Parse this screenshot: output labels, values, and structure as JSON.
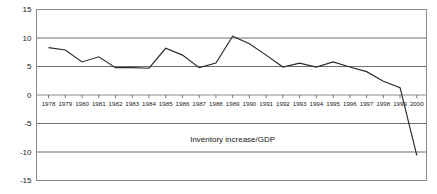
{
  "chart_data": {
    "type": "line",
    "title": "",
    "subtitle": "",
    "xlabel": "",
    "ylabel": "",
    "ylim": [
      -15,
      15
    ],
    "yticks": [
      15,
      10,
      5,
      0,
      -5,
      -10,
      -15
    ],
    "ytick_labels": [
      "15",
      "10",
      "5",
      "0",
      "-5",
      "-10",
      "-15"
    ],
    "grid": true,
    "grid_axis": "y",
    "legend": false,
    "legend_position": "none",
    "annotations": [
      {
        "text": "Inventory increase/GDP",
        "x": 1989,
        "y": -8.2
      }
    ],
    "categories": [
      "1978",
      "1979",
      "1980",
      "1981",
      "1982",
      "1983",
      "1984",
      "1985",
      "1986",
      "1987",
      "1988",
      "1989",
      "1990",
      "1991",
      "1992",
      "1993",
      "1994",
      "1995",
      "1996",
      "1997",
      "1998",
      "1999",
      "2000"
    ],
    "x": [
      1978,
      1979,
      1980,
      1981,
      1982,
      1983,
      1984,
      1985,
      1986,
      1987,
      1988,
      1989,
      1990,
      1991,
      1992,
      1993,
      1994,
      1995,
      1996,
      1997,
      1998,
      1999,
      2000
    ],
    "series": [
      {
        "name": "Inventory increase/GDP",
        "color": "#2a2a2a",
        "values": [
          8.3,
          7.9,
          5.8,
          6.7,
          4.8,
          4.8,
          4.7,
          8.2,
          7.0,
          4.8,
          5.6,
          10.3,
          9.0,
          7.0,
          4.9,
          5.6,
          4.9,
          5.8,
          4.9,
          4.1,
          2.4,
          1.3,
          -10.6
        ]
      }
    ]
  },
  "colors": {
    "background": "#ffffff",
    "frame": "#8a8a8a",
    "gridline": "#6f6f6f",
    "series": "#2a2a2a",
    "text": "#1a1a1a"
  }
}
